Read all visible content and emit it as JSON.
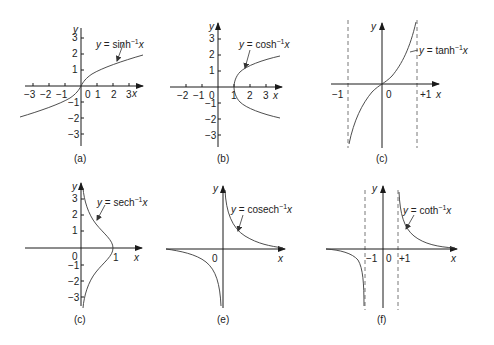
{
  "figure": {
    "panels": [
      {
        "id": "a",
        "caption": "(a)",
        "function": "y = sinh⁻¹x",
        "label_y": "y",
        "label_x": "x",
        "x_ticks": [
          "−3",
          "−2",
          "−1",
          "0",
          "1",
          "2",
          "3"
        ],
        "y_ticks": [
          "3",
          "2",
          "1",
          "−1",
          "−2",
          "−3"
        ]
      },
      {
        "id": "b",
        "caption": "(b)",
        "function": "y = cosh⁻¹x",
        "label_y": "y",
        "label_x": "x",
        "x_ticks": [
          "−2",
          "−1",
          "0",
          "1",
          "2",
          "3"
        ],
        "y_ticks": [
          "3",
          "2",
          "1",
          "−1",
          "−2",
          "−3"
        ]
      },
      {
        "id": "c1",
        "caption": "(c)",
        "function": "y = tanh⁻¹x",
        "label_y": "y",
        "label_x": "x",
        "x_ticks": [
          "−1",
          "0",
          "+1"
        ],
        "asymptotes": [
          "x = −1",
          "x = +1"
        ]
      },
      {
        "id": "c2",
        "caption": "(c)",
        "function": "y = sech⁻¹x",
        "label_y": "y",
        "label_x": "x",
        "x_ticks": [
          "0",
          "1"
        ],
        "y_ticks": [
          "3",
          "2",
          "1",
          "−1",
          "−2",
          "−3"
        ]
      },
      {
        "id": "e",
        "caption": "(e)",
        "function": "y = cosech⁻¹x",
        "label_y": "y",
        "label_x": "x",
        "x_ticks": [
          "0"
        ]
      },
      {
        "id": "f",
        "caption": "(f)",
        "function": "y = coth⁻¹x",
        "label_y": "y",
        "label_x": "x",
        "x_ticks": [
          "−1",
          "0",
          "+1"
        ],
        "asymptotes": [
          "x = −1",
          "x = +1"
        ]
      }
    ]
  },
  "text": {
    "a": {
      "y": "y",
      "x": "x",
      "fn_pre": "y",
      "fn_eq": " = sinh",
      "fn_sup": "−1",
      "fn_var": "x",
      "cap": "(a)",
      "xm3": "−3",
      "xm2": "−2",
      "xm1": "−1",
      "x0": "0",
      "x1": "1",
      "x2": "2",
      "x3": "3",
      "y3": "3",
      "y2": "2",
      "y1": "1",
      "ym1": "−1",
      "ym2": "−2",
      "ym3": "−3"
    },
    "b": {
      "y": "y",
      "x": "x",
      "fn_pre": "y",
      "fn_eq": " = cosh",
      "fn_sup": "−1",
      "fn_var": "x",
      "cap": "(b)",
      "xm2": "−2",
      "xm1": "−1",
      "x0": "0",
      "x1": "1",
      "x2": "2",
      "x3": "3",
      "y3": "3",
      "y2": "2",
      "y1": "1",
      "ym1": "−1",
      "ym2": "−2",
      "ym3": "−3"
    },
    "c1": {
      "y": "y",
      "x": "x",
      "fn_pre": "y",
      "fn_eq": " = tanh",
      "fn_sup": "−1",
      "fn_var": "x",
      "cap": "(c)",
      "xm1": "−1",
      "x0": "0",
      "xp1": "+1"
    },
    "c2": {
      "y": "y",
      "x": "x",
      "fn_pre": "y",
      "fn_eq": " = sech",
      "fn_sup": "−1",
      "fn_var": "x",
      "cap": "(c)",
      "x0": "0",
      "x1": "1",
      "y3": "3",
      "y2": "2",
      "y1": "1",
      "ym1": "−1",
      "ym2": "−2",
      "ym3": "−3"
    },
    "e": {
      "y": "y",
      "x": "x",
      "fn_pre": "y",
      "fn_eq": " = cosech",
      "fn_sup": "−1",
      "fn_var": "x",
      "cap": "(e)",
      "x0": "0"
    },
    "f": {
      "y": "y",
      "x": "x",
      "fn_pre": "y",
      "fn_eq": " = coth",
      "fn_sup": "−1",
      "fn_var": "x",
      "cap": "(f)",
      "xm1": "−1",
      "x0": "0",
      "xp1": "+1"
    }
  }
}
